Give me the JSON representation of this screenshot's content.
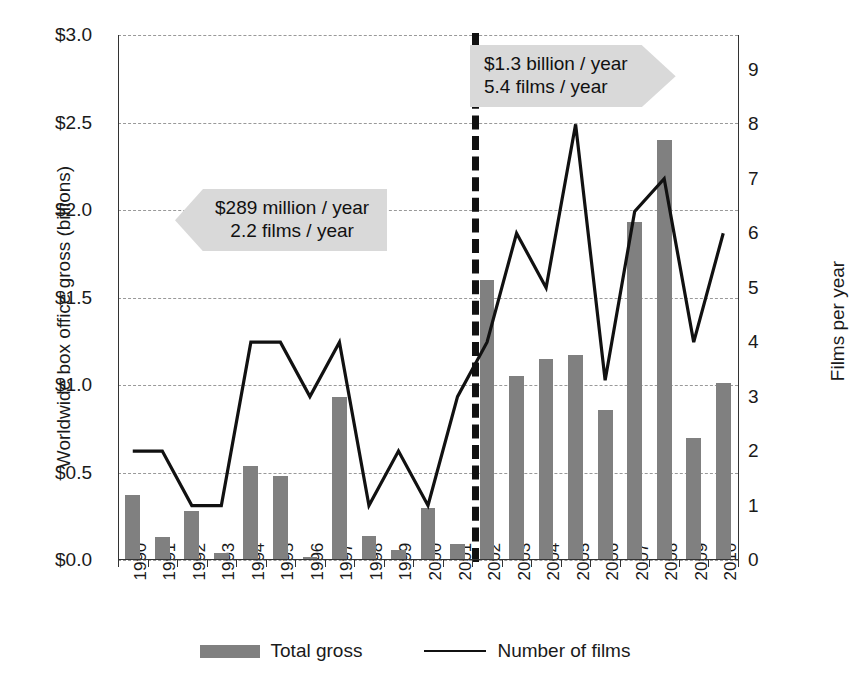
{
  "chart_data": {
    "type": "bar",
    "title": "",
    "xlabel": "",
    "ylabel": "Worldwide box office gross (billions)",
    "y2label": "Films per year",
    "categories": [
      "1990",
      "1991",
      "1992",
      "1993",
      "1994",
      "1995",
      "1996",
      "1997",
      "1998",
      "1999",
      "2000",
      "2001",
      "2002",
      "2003",
      "2004",
      "2005",
      "2006",
      "2007",
      "2008",
      "2009",
      "2010"
    ],
    "ylim": [
      0,
      3.0
    ],
    "y2lim": [
      0,
      9.64
    ],
    "yticks": [
      "$0.0",
      "$0.5",
      "$1.0",
      "$1.5",
      "$2.0",
      "$2.5",
      "$3.0"
    ],
    "ytick_values": [
      0.0,
      0.5,
      1.0,
      1.5,
      2.0,
      2.5,
      3.0
    ],
    "y2ticks": [
      "0",
      "1",
      "2",
      "3",
      "4",
      "5",
      "6",
      "7",
      "8",
      "9"
    ],
    "y2tick_values": [
      0,
      1,
      2,
      3,
      4,
      5,
      6,
      7,
      8,
      9
    ],
    "grid": true,
    "legend_position": "bottom",
    "series": [
      {
        "name": "Total gross",
        "type": "bar",
        "axis": "left",
        "color": "#808080",
        "values": [
          0.37,
          0.13,
          0.28,
          0.04,
          0.54,
          0.48,
          0.02,
          0.93,
          0.14,
          0.06,
          0.3,
          0.09,
          1.6,
          1.05,
          1.15,
          1.17,
          0.86,
          1.93,
          2.4,
          0.7,
          1.01
        ]
      },
      {
        "name": "Number of films",
        "type": "line",
        "axis": "right",
        "color": "#111111",
        "values": [
          2,
          2,
          1,
          1,
          4,
          4,
          3,
          4,
          1,
          2,
          1,
          3,
          4,
          6,
          5,
          8,
          3.3,
          6.4,
          7,
          4,
          6
        ]
      }
    ],
    "annotations": [
      {
        "name": "pre-2002-average",
        "lines": [
          "$289 million / year",
          "2.2 films / year"
        ],
        "shape": "left-arrow",
        "fill": "#d9d9d9"
      },
      {
        "name": "post-2001-average",
        "lines": [
          "$1.3 billion / year",
          "5.4 films / year"
        ],
        "shape": "right-arrow",
        "fill": "#d9d9d9"
      }
    ],
    "divider": {
      "after_category": "2001",
      "style": "dashed",
      "color": "#111111"
    }
  },
  "legend": {
    "items": [
      {
        "label": "Total gross",
        "marker": "bar-swatch",
        "color": "#808080"
      },
      {
        "label": "Number of films",
        "marker": "line-swatch",
        "color": "#111111"
      }
    ]
  }
}
